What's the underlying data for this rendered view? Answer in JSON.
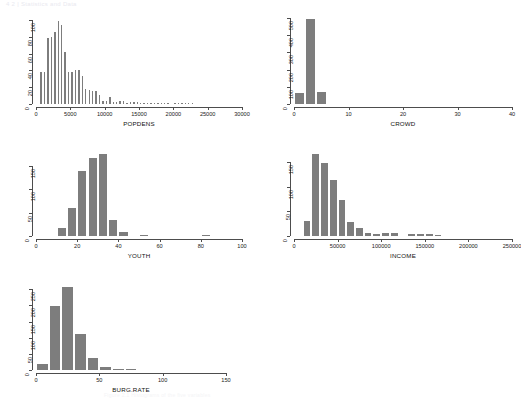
{
  "page": {
    "header_text": "4 2 | Statistics and Data",
    "footer_text": "Figure 2.1  Histograms of the five variables"
  },
  "style": {
    "bar_fill": "#7d7d7d",
    "axis_color": "#4d4d4d",
    "background": "#ffffff"
  },
  "chart_data": [
    {
      "id": "popdens",
      "type": "bar",
      "title": "",
      "xlabel": "POPDENS",
      "ylabel": "",
      "xlim": [
        0,
        30000
      ],
      "ylim": [
        0,
        100
      ],
      "xticks": [
        0,
        5000,
        10000,
        15000,
        20000,
        25000,
        30000
      ],
      "xtick_labels": [
        "0",
        "5000",
        "10000",
        "15000",
        "20000",
        "25000",
        "30000"
      ],
      "yticks": [
        0,
        20,
        40,
        60,
        80,
        100
      ],
      "ytick_labels": [
        "0",
        "20",
        "40",
        "60",
        "80",
        "100"
      ],
      "grid": false,
      "legend": "none",
      "bin_width": 500,
      "bin_starts": [
        500,
        1000,
        1500,
        2000,
        2500,
        3000,
        3500,
        4000,
        4500,
        5000,
        5500,
        6000,
        6500,
        7000,
        7500,
        8000,
        8500,
        9000,
        9500,
        10000,
        10500,
        11000,
        11500,
        12000,
        12500,
        13000,
        13500,
        14000,
        14500,
        15000,
        15500,
        16000,
        16500,
        17000,
        17500,
        18000,
        18500,
        19000,
        20000,
        20500,
        21000,
        21500,
        22000,
        22500
      ],
      "values": [
        38,
        38,
        78,
        80,
        86,
        99,
        94,
        62,
        38,
        38,
        40,
        40,
        33,
        18,
        17,
        16,
        15,
        11,
        4,
        4,
        8,
        2,
        2,
        3,
        3,
        1,
        2,
        2,
        2,
        1,
        1,
        1,
        1,
        1,
        1,
        1,
        1,
        1,
        1,
        1,
        1,
        1,
        1,
        1
      ]
    },
    {
      "id": "crowd",
      "type": "bar",
      "title": "",
      "xlabel": "CROWD",
      "ylabel": "",
      "xlim": [
        0,
        40
      ],
      "ylim": [
        0,
        500
      ],
      "xticks": [
        0,
        10,
        20,
        30,
        40
      ],
      "xtick_labels": [
        "0",
        "10",
        "20",
        "30",
        "40"
      ],
      "yticks": [
        0,
        100,
        200,
        300,
        400,
        500
      ],
      "ytick_labels": [
        "0",
        "100",
        "200",
        "300",
        "400",
        "500"
      ],
      "grid": false,
      "legend": "none",
      "bin_width": 2,
      "bin_starts": [
        0,
        2,
        4
      ],
      "values": [
        65,
        492,
        68
      ]
    },
    {
      "id": "youth",
      "type": "bar",
      "title": "",
      "xlabel": "YOUTH",
      "ylabel": "",
      "xlim": [
        0,
        100
      ],
      "ylim": [
        0,
        180
      ],
      "xticks": [
        0,
        20,
        40,
        60,
        80,
        100
      ],
      "xtick_labels": [
        "0",
        "20",
        "40",
        "60",
        "80",
        "100"
      ],
      "yticks": [
        0,
        50,
        100,
        150
      ],
      "ytick_labels": [
        "0",
        "50",
        "100",
        "150"
      ],
      "grid": false,
      "legend": "none",
      "bin_width": 5,
      "bin_starts": [
        10,
        15,
        20,
        25,
        30,
        35,
        40,
        50,
        80
      ],
      "values": [
        17,
        60,
        139,
        168,
        176,
        34,
        8,
        2,
        2
      ]
    },
    {
      "id": "income",
      "type": "bar",
      "title": "",
      "xlabel": "INCOME",
      "ylabel": "",
      "xlim": [
        0,
        250000
      ],
      "ylim": [
        0,
        170
      ],
      "xticks": [
        0,
        50000,
        100000,
        150000,
        200000,
        250000
      ],
      "xtick_labels": [
        "0",
        "50000",
        "100000",
        "150000",
        "200000",
        "250000"
      ],
      "yticks": [
        0,
        50,
        100,
        150
      ],
      "ytick_labels": [
        "0",
        "50",
        "100",
        "150"
      ],
      "grid": false,
      "legend": "none",
      "bin_width": 10000,
      "bin_starts": [
        10000,
        20000,
        30000,
        40000,
        50000,
        60000,
        70000,
        80000,
        90000,
        100000,
        110000,
        130000,
        140000,
        150000,
        160000
      ],
      "values": [
        30,
        165,
        147,
        114,
        72,
        29,
        17,
        6,
        4,
        6,
        6,
        4,
        5,
        4,
        2
      ]
    },
    {
      "id": "burgrate",
      "type": "bar",
      "title": "",
      "xlabel": "BURG.RATE",
      "ylabel": "",
      "xlim": [
        0,
        150
      ],
      "ylim": [
        0,
        260
      ],
      "xticks": [
        0,
        50,
        100,
        150
      ],
      "xtick_labels": [
        "0",
        "50",
        "100",
        "150"
      ],
      "yticks": [
        0,
        50,
        100,
        150,
        200,
        250
      ],
      "ytick_labels": [
        "0",
        "50",
        "100",
        "150",
        "200",
        "250"
      ],
      "grid": false,
      "legend": "none",
      "bin_width": 10,
      "bin_starts": [
        0,
        10,
        20,
        30,
        40,
        50,
        60,
        70
      ],
      "values": [
        18,
        198,
        258,
        112,
        36,
        9,
        2,
        1
      ]
    }
  ],
  "layout": {
    "panels": [
      {
        "id": "popdens",
        "left": 14,
        "top": 16,
        "plot_left": 22,
        "plot_top": 4,
        "plot_w": 206,
        "plot_h": 84
      },
      {
        "id": "crowd",
        "left": 272,
        "top": 14,
        "plot_left": 22,
        "plot_top": 4,
        "plot_w": 218,
        "plot_h": 86
      },
      {
        "id": "youth",
        "left": 14,
        "top": 148,
        "plot_left": 22,
        "plot_top": 4,
        "plot_w": 206,
        "plot_h": 84
      },
      {
        "id": "income",
        "left": 272,
        "top": 148,
        "plot_left": 22,
        "plot_top": 4,
        "plot_w": 218,
        "plot_h": 84
      },
      {
        "id": "burgrate",
        "left": 14,
        "top": 282,
        "plot_left": 22,
        "plot_top": 4,
        "plot_w": 190,
        "plot_h": 84
      }
    ]
  }
}
